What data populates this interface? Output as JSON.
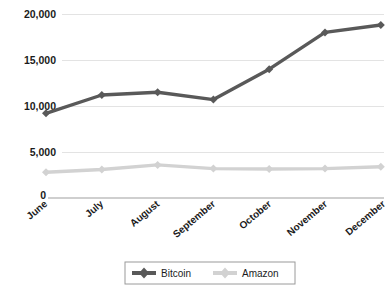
{
  "chart_data": {
    "type": "line",
    "title": "",
    "xlabel": "",
    "ylabel": "",
    "categories": [
      "June",
      "July",
      "August",
      "September",
      "October",
      "November",
      "December"
    ],
    "ylim": [
      0,
      20000
    ],
    "yticks": [
      0,
      5000,
      10000,
      15000,
      20000
    ],
    "ytick_labels": [
      "0",
      "5,000",
      "10,000",
      "15,000",
      "20,000"
    ],
    "grid": "horizontal",
    "legend_position": "bottom-center",
    "series": [
      {
        "name": "Bitcoin",
        "color": "#595959",
        "marker": "diamond",
        "values": [
          9200,
          11200,
          11500,
          10700,
          14000,
          18000,
          18800
        ]
      },
      {
        "name": "Amazon",
        "color": "#d2d2d2",
        "marker": "diamond",
        "values": [
          2800,
          3100,
          3600,
          3200,
          3150,
          3200,
          3400
        ]
      }
    ]
  },
  "legend": {
    "items": [
      {
        "label": "Bitcoin",
        "color": "#595959"
      },
      {
        "label": "Amazon",
        "color": "#d2d2d2"
      }
    ]
  },
  "axes": {
    "y_tick_labels": [
      "20,000",
      "15,000",
      "10,000",
      "5,000"
    ],
    "origin_label": "0",
    "x_tick_labels": [
      "June",
      "July",
      "August",
      "September",
      "October",
      "November",
      "December"
    ]
  },
  "colors": {
    "background": "#ffffff",
    "gridline": "#e3e3e3",
    "axis": "#cfcfcf",
    "series_bitcoin": "#595959",
    "series_amazon": "#d2d2d2",
    "text": "#1b1b1b"
  }
}
